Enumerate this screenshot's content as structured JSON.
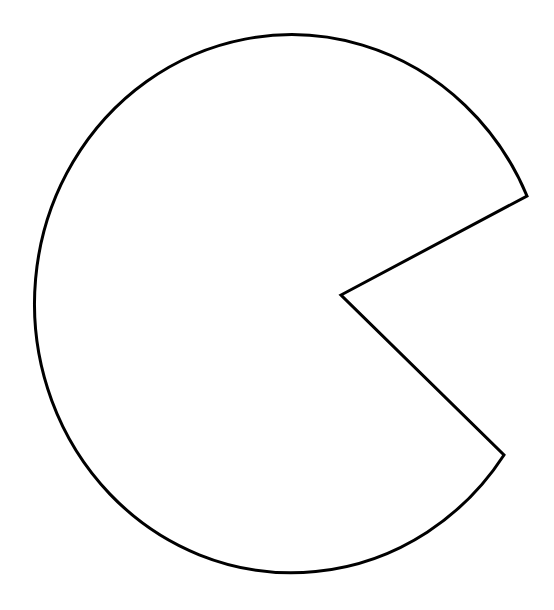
{
  "figure": {
    "shape": "pac-man-sector",
    "canvas": {
      "width": 554,
      "height": 610,
      "background": "#ffffff"
    },
    "stroke_color": "#000000",
    "fill_color": "#ffffff",
    "stroke_width": 3,
    "ellipse": {
      "cx": 289,
      "cy": 303,
      "rx": 257,
      "ry": 269
    },
    "notch": {
      "upper_point": [
        527,
        196
      ],
      "vertex": [
        341,
        295
      ],
      "lower_point": [
        504,
        455
      ]
    }
  }
}
